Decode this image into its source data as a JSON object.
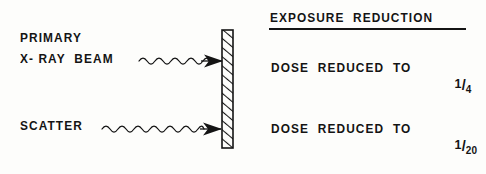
{
  "diagram": {
    "background_color": "#fdfdfb",
    "ink_color": "#141414"
  },
  "left_panel": {
    "primary_beam": {
      "label_line1": "PRIMARY",
      "label_line2": "X- RAY  BEAM",
      "arrow_name": "wavy-arrow-primary",
      "arrow_direction": "right",
      "arrow_style": "wavy-with-solid-arrowhead"
    },
    "scatter": {
      "label": "SCATTER",
      "arrow_name": "wavy-arrow-scatter",
      "arrow_direction": "right",
      "arrow_style": "wavy-with-solid-arrowhead"
    }
  },
  "barrier": {
    "name": "hatched-barrier",
    "description": "vertical cross-hatched shield",
    "fill_pattern": "diagonal-hatch",
    "outline_color": "#141414"
  },
  "right_panel": {
    "heading": "EXPOSURE  REDUCTION",
    "rows": [
      {
        "text": "DOSE  REDUCED  TO",
        "fraction_numerator": "1",
        "fraction_slash": "/",
        "fraction_denominator": "4"
      },
      {
        "text": "DOSE  REDUCED  TO",
        "fraction_numerator": "1",
        "fraction_slash": "/",
        "fraction_denominator": "20"
      }
    ]
  }
}
